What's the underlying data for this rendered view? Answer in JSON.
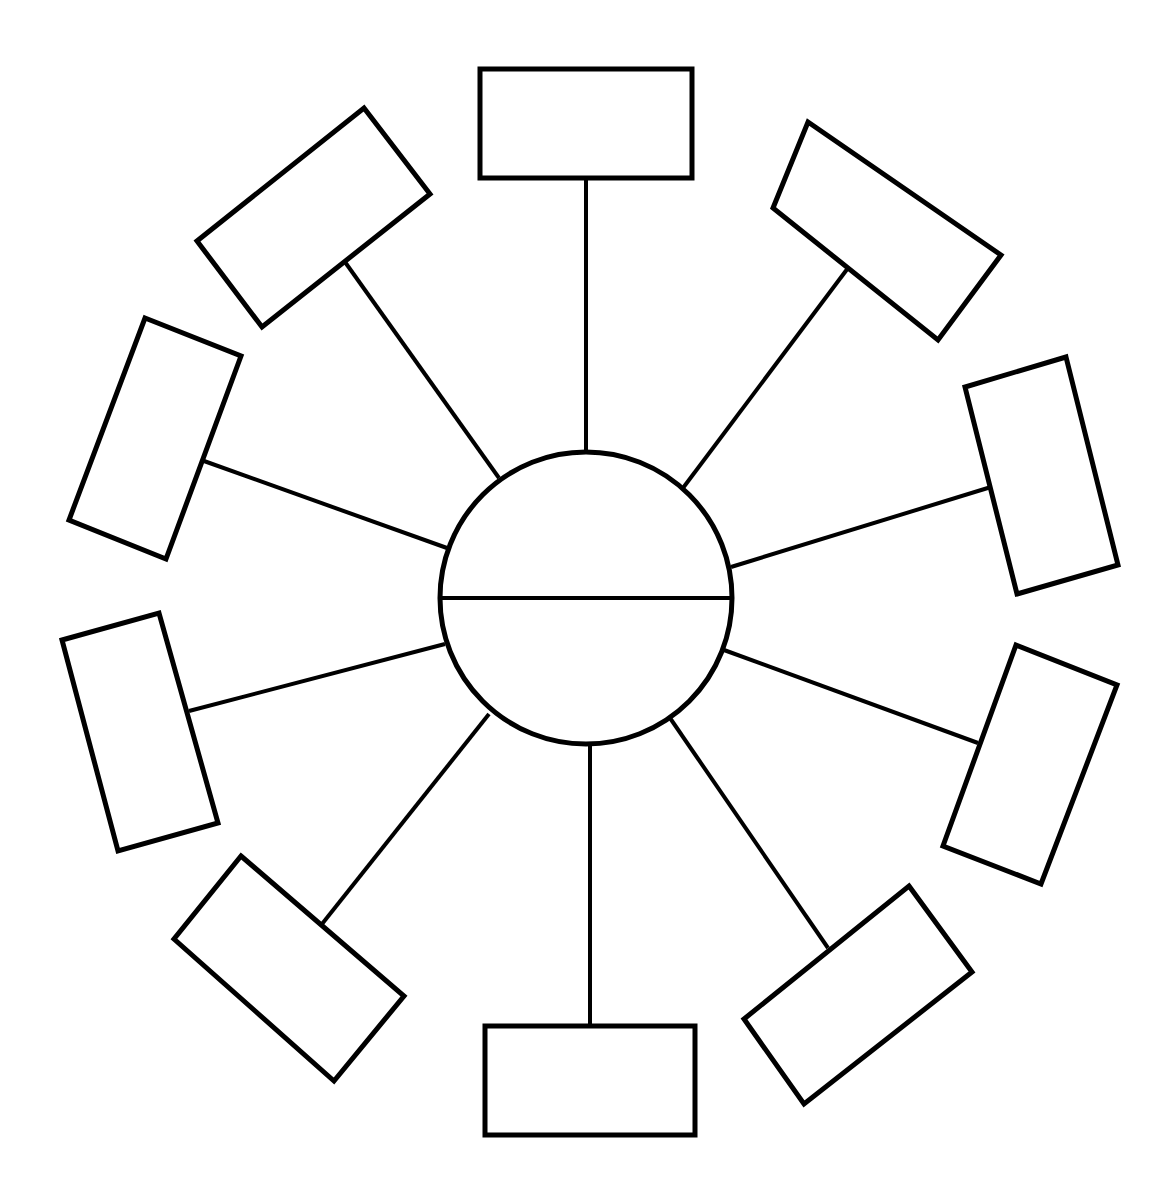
{
  "diagram": {
    "type": "radial-spoke-organizer",
    "colors": {
      "stroke": "#000000",
      "background": "#ffffff"
    },
    "center": {
      "shape": "circle-divided-horizontally",
      "cx": 586,
      "cy": 598,
      "r": 146,
      "top_half_text": "",
      "bottom_half_text": ""
    },
    "spokes": [
      {
        "id": "top",
        "from": [
          586,
          452
        ],
        "to": [
          586,
          178
        ],
        "box": [
          [
            480,
            69
          ],
          [
            692,
            69
          ],
          [
            692,
            178
          ],
          [
            480,
            178
          ]
        ],
        "text": ""
      },
      {
        "id": "top-right",
        "from": [
          683,
          488
        ],
        "to": [
          848,
          268
        ],
        "box": [
          [
            808,
            122
          ],
          [
            1001,
            255
          ],
          [
            938,
            340
          ],
          [
            773,
            208
          ]
        ],
        "text": ""
      },
      {
        "id": "right-upper",
        "from": [
          731,
          567
        ],
        "to": [
          991,
          487
        ],
        "box": [
          [
            1066,
            357
          ],
          [
            1118,
            565
          ],
          [
            1017,
            594
          ],
          [
            965,
            387
          ]
        ],
        "text": ""
      },
      {
        "id": "right-lower",
        "from": [
          724,
          650
        ],
        "to": [
          978,
          743
        ],
        "box": [
          [
            1016,
            645
          ],
          [
            1117,
            685
          ],
          [
            1041,
            884
          ],
          [
            943,
            846
          ]
        ],
        "text": ""
      },
      {
        "id": "bottom-right",
        "from": [
          670,
          718
        ],
        "to": [
          828,
          948
        ],
        "box": [
          [
            909,
            886
          ],
          [
            972,
            972
          ],
          [
            804,
            1104
          ],
          [
            744,
            1019
          ]
        ],
        "text": ""
      },
      {
        "id": "bottom",
        "from": [
          590,
          744
        ],
        "to": [
          590,
          1026
        ],
        "box": [
          [
            485,
            1026
          ],
          [
            695,
            1026
          ],
          [
            695,
            1135
          ],
          [
            485,
            1135
          ]
        ],
        "text": ""
      },
      {
        "id": "bottom-left",
        "from": [
          489,
          714
        ],
        "to": [
          322,
          924
        ],
        "box": [
          [
            241,
            856
          ],
          [
            404,
            996
          ],
          [
            334,
            1081
          ],
          [
            174,
            939
          ]
        ],
        "text": ""
      },
      {
        "id": "left-lower",
        "from": [
          445,
          644
        ],
        "to": [
          189,
          711
        ],
        "box": [
          [
            62,
            640
          ],
          [
            159,
            613
          ],
          [
            218,
            823
          ],
          [
            118,
            851
          ]
        ],
        "text": ""
      },
      {
        "id": "left-upper",
        "from": [
          447,
          548
        ],
        "to": [
          204,
          461
        ],
        "box": [
          [
            145,
            318
          ],
          [
            241,
            356
          ],
          [
            166,
            559
          ],
          [
            69,
            520
          ]
        ],
        "text": ""
      },
      {
        "id": "top-left",
        "from": [
          499,
          478
        ],
        "to": [
          345,
          262
        ],
        "box": [
          [
            364,
            108
          ],
          [
            430,
            194
          ],
          [
            262,
            327
          ],
          [
            197,
            241
          ]
        ],
        "text": ""
      }
    ]
  }
}
